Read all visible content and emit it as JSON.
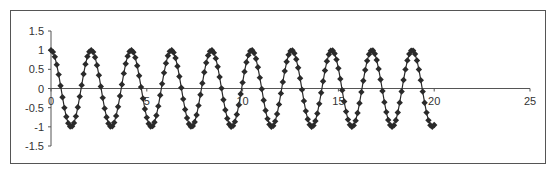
{
  "chart_data": {
    "type": "scatter",
    "title": "",
    "xlabel": "",
    "ylabel": "",
    "function": "y = cos(3x)",
    "xlim": [
      0,
      25
    ],
    "ylim": [
      -1.5,
      1.5
    ],
    "x_ticks": [
      0,
      5,
      10,
      15,
      20,
      25
    ],
    "y_ticks": [
      1.5,
      1,
      0.5,
      0,
      -0.5,
      -1,
      -1.5
    ],
    "x_tick_labels": [
      "0",
      "5",
      "10",
      "15",
      "20",
      "25"
    ],
    "y_tick_labels": [
      "1.5",
      "1",
      "0.5",
      "0",
      "-0.5",
      "-1",
      "-1.5"
    ],
    "grid": false,
    "legend": null,
    "series": [
      {
        "name": "Series1",
        "marker": "diamond",
        "line": true,
        "color": "#2a2a2a",
        "x_start": 0,
        "x_end": 20,
        "x_step": 0.1,
        "sample_points": [
          [
            0,
            1
          ],
          [
            0.5,
            0.07
          ],
          [
            1,
            -0.99
          ],
          [
            1.5,
            -0.21
          ],
          [
            2.1,
            1.0
          ],
          [
            3.1,
            -1.0
          ],
          [
            4.2,
            1.0
          ],
          [
            5.2,
            -1.0
          ],
          [
            6.3,
            1.0
          ],
          [
            7.3,
            -1.0
          ],
          [
            8.4,
            1.0
          ],
          [
            9.4,
            -1.0
          ],
          [
            10.5,
            1.0
          ],
          [
            11.5,
            -1.0
          ],
          [
            12.6,
            1.0
          ],
          [
            13.6,
            -1.0
          ],
          [
            14.7,
            1.0
          ],
          [
            15.7,
            -1.0
          ],
          [
            16.8,
            1.0
          ],
          [
            17.8,
            -1.0
          ],
          [
            18.8,
            1.0
          ],
          [
            20,
            -0.95
          ]
        ]
      }
    ]
  },
  "colors": {
    "axis": "#555555",
    "frame": "#555555",
    "series": "#2a2a2a"
  }
}
